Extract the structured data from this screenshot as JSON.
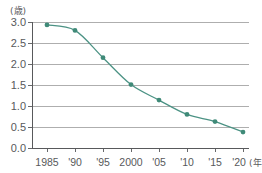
{
  "chart_data": {
    "type": "line",
    "title": "",
    "xlabel": "(年)",
    "ylabel": "(歳)",
    "x": [
      1985,
      1990,
      1995,
      2000,
      2005,
      2010,
      2015,
      2020
    ],
    "categories": [
      "1985",
      "'90",
      "'95",
      "2000",
      "'05",
      "'10",
      "'15",
      "'20"
    ],
    "values": [
      2.93,
      2.8,
      2.15,
      1.51,
      1.14,
      0.8,
      0.63,
      0.38
    ],
    "series": [
      {
        "name": "",
        "values": [
          2.93,
          2.8,
          2.15,
          1.51,
          1.14,
          0.8,
          0.63,
          0.38
        ]
      }
    ],
    "ylim": [
      0.0,
      3.0
    ],
    "ytick_labels": [
      "3.0",
      "2.5",
      "2.0",
      "1.5",
      "1.0",
      "0.5",
      "0.0"
    ],
    "ytick_values": [
      3.0,
      2.5,
      2.0,
      1.5,
      1.0,
      0.5,
      0.0
    ],
    "xtick_labels": [
      "1985",
      "'90",
      "'95",
      "2000",
      "'05",
      "'10",
      "'15",
      "'20"
    ],
    "grid": "horizontal",
    "legend": "none",
    "marker": "circle",
    "colors": {
      "series_line": "#4b9284",
      "series_marker": "#3f8a78",
      "gridline": "#8c8c8c",
      "axis": "#58595b",
      "text": "#58595b",
      "background": "#ffffff"
    }
  },
  "axes": {
    "y_unit": "(歳)",
    "x_unit": "(年)"
  }
}
